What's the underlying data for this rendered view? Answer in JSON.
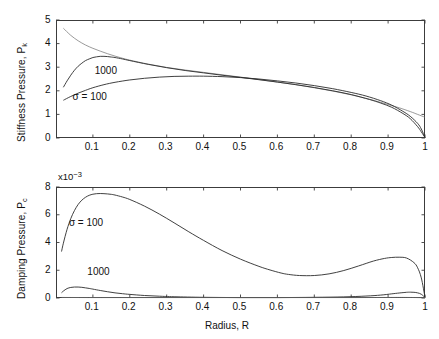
{
  "figure": {
    "background": "#ffffff",
    "axis_color": "#3c3c3c",
    "curve_color": "#2b2b2b",
    "curve_thin_color": "#6e6e6e"
  },
  "chart_data": [
    {
      "id": "stiffness",
      "type": "line",
      "title": "",
      "xlabel": "",
      "ylabel": "Stiffness Pressure, P",
      "ylabel_sub": "k",
      "xlim": [
        0,
        1
      ],
      "ylim": [
        0,
        5
      ],
      "xticks": [
        0.1,
        0.2,
        0.3,
        0.4,
        0.5,
        0.6,
        0.7,
        0.8,
        0.9,
        1
      ],
      "xticklabels": [
        "0.1",
        "0.2",
        "0.3",
        "0.4",
        "0.5",
        "0.6",
        "0.7",
        "0.8",
        "0.9",
        "1"
      ],
      "yticks": [
        0,
        1,
        2,
        3,
        4,
        5
      ],
      "yticklabels": [
        "0",
        "1",
        "2",
        "3",
        "4",
        "5"
      ],
      "grid": false,
      "legend_position": "inline-annotations",
      "annotations": [
        {
          "text": "1000",
          "x": 0.105,
          "y": 2.82
        },
        {
          "text": "σ = 100",
          "x": 0.045,
          "y": 1.72
        }
      ],
      "series": [
        {
          "name": "asymptotic",
          "style": "thin",
          "x": [
            0.02,
            0.04,
            0.06,
            0.08,
            0.1,
            0.12,
            0.14,
            0.16,
            0.18,
            0.2,
            0.25,
            0.3,
            0.35,
            0.4,
            0.45,
            0.5,
            0.55,
            0.6,
            0.65,
            0.7,
            0.75,
            0.8,
            0.85,
            0.9,
            0.93,
            0.96,
            0.98,
            1.0
          ],
          "y": [
            4.65,
            4.35,
            4.12,
            3.94,
            3.8,
            3.68,
            3.57,
            3.47,
            3.38,
            3.3,
            3.13,
            2.99,
            2.88,
            2.78,
            2.68,
            2.58,
            2.48,
            2.37,
            2.26,
            2.13,
            1.99,
            1.83,
            1.64,
            1.42,
            1.28,
            1.12,
            1.0,
            0.88
          ]
        },
        {
          "name": "1000",
          "style": "normal",
          "x": [
            0.02,
            0.03,
            0.04,
            0.05,
            0.06,
            0.07,
            0.08,
            0.09,
            0.1,
            0.11,
            0.12,
            0.13,
            0.14,
            0.15,
            0.16,
            0.18,
            0.2,
            0.25,
            0.3,
            0.35,
            0.4,
            0.45,
            0.5,
            0.55,
            0.6,
            0.65,
            0.7,
            0.75,
            0.8,
            0.85,
            0.88,
            0.91,
            0.94,
            0.96,
            0.98,
            0.99,
            1.0
          ],
          "y": [
            2.15,
            2.42,
            2.66,
            2.87,
            3.04,
            3.17,
            3.28,
            3.35,
            3.41,
            3.44,
            3.46,
            3.46,
            3.45,
            3.43,
            3.41,
            3.35,
            3.28,
            3.12,
            2.98,
            2.86,
            2.76,
            2.66,
            2.57,
            2.47,
            2.37,
            2.26,
            2.14,
            2.0,
            1.84,
            1.63,
            1.48,
            1.3,
            1.04,
            0.82,
            0.48,
            0.26,
            0.02
          ]
        },
        {
          "name": "100",
          "style": "normal",
          "x": [
            0.02,
            0.04,
            0.06,
            0.08,
            0.1,
            0.13,
            0.16,
            0.2,
            0.24,
            0.28,
            0.32,
            0.36,
            0.4,
            0.45,
            0.5,
            0.55,
            0.6,
            0.65,
            0.7,
            0.75,
            0.8,
            0.84,
            0.88,
            0.91,
            0.94,
            0.96,
            0.98,
            0.99,
            1.0
          ],
          "y": [
            1.6,
            1.76,
            1.9,
            2.02,
            2.13,
            2.26,
            2.36,
            2.46,
            2.53,
            2.58,
            2.61,
            2.62,
            2.62,
            2.6,
            2.56,
            2.5,
            2.42,
            2.33,
            2.22,
            2.09,
            1.93,
            1.78,
            1.58,
            1.39,
            1.13,
            0.92,
            0.62,
            0.38,
            0.02
          ]
        }
      ]
    },
    {
      "id": "damping",
      "type": "line",
      "title": "",
      "xlabel": "Radius, R",
      "ylabel": "Damping Pressure, P",
      "ylabel_sub": "c",
      "y_exponent": "x10",
      "y_exponent_power": "−3",
      "xlim": [
        0,
        1
      ],
      "ylim": [
        0,
        8
      ],
      "xticks": [
        0.1,
        0.2,
        0.3,
        0.4,
        0.5,
        0.6,
        0.7,
        0.8,
        0.9,
        1
      ],
      "xticklabels": [
        "0.1",
        "0.2",
        "0.3",
        "0.4",
        "0.5",
        "0.6",
        "0.7",
        "0.8",
        "0.9",
        "1"
      ],
      "yticks": [
        0,
        2,
        4,
        6,
        8
      ],
      "yticklabels": [
        "0",
        "2",
        "4",
        "6",
        "8"
      ],
      "grid": false,
      "legend_position": "inline-annotations",
      "annotations": [
        {
          "text": "σ = 100",
          "x": 0.035,
          "y": 5.35
        },
        {
          "text": "1000",
          "x": 0.085,
          "y": 1.85
        }
      ],
      "series": [
        {
          "name": "100",
          "style": "normal",
          "x": [
            0.015,
            0.02,
            0.03,
            0.04,
            0.05,
            0.06,
            0.07,
            0.08,
            0.09,
            0.1,
            0.11,
            0.12,
            0.13,
            0.14,
            0.15,
            0.16,
            0.18,
            0.2,
            0.24,
            0.28,
            0.32,
            0.36,
            0.4,
            0.45,
            0.5,
            0.55,
            0.58,
            0.61,
            0.63,
            0.66,
            0.7,
            0.74,
            0.78,
            0.82,
            0.86,
            0.89,
            0.91,
            0.93,
            0.95,
            0.97,
            0.98,
            0.99,
            1.0
          ],
          "y": [
            3.35,
            3.95,
            4.95,
            5.72,
            6.3,
            6.74,
            7.05,
            7.26,
            7.4,
            7.48,
            7.52,
            7.53,
            7.52,
            7.5,
            7.47,
            7.42,
            7.28,
            7.1,
            6.62,
            6.05,
            5.42,
            4.77,
            4.15,
            3.42,
            2.8,
            2.28,
            2.02,
            1.8,
            1.7,
            1.62,
            1.62,
            1.74,
            1.98,
            2.31,
            2.66,
            2.85,
            2.92,
            2.94,
            2.88,
            2.55,
            2.18,
            1.45,
            0.05
          ]
        },
        {
          "name": "1000",
          "style": "normal",
          "x": [
            0.015,
            0.02,
            0.03,
            0.04,
            0.05,
            0.06,
            0.07,
            0.08,
            0.09,
            0.1,
            0.12,
            0.14,
            0.16,
            0.18,
            0.2,
            0.24,
            0.28,
            0.32,
            0.4,
            0.5,
            0.6,
            0.7,
            0.78,
            0.84,
            0.88,
            0.91,
            0.93,
            0.95,
            0.96,
            0.97,
            0.98,
            0.99,
            1.0
          ],
          "y": [
            0.38,
            0.5,
            0.68,
            0.76,
            0.79,
            0.79,
            0.77,
            0.73,
            0.69,
            0.64,
            0.54,
            0.45,
            0.37,
            0.31,
            0.26,
            0.18,
            0.13,
            0.09,
            0.05,
            0.03,
            0.03,
            0.05,
            0.08,
            0.14,
            0.21,
            0.3,
            0.36,
            0.41,
            0.42,
            0.41,
            0.37,
            0.27,
            0.03
          ]
        },
        {
          "name": "baseline",
          "style": "thin",
          "x": [
            0.015,
            0.1,
            0.2,
            0.3,
            0.4,
            0.5,
            0.6,
            0.7,
            0.8,
            0.9,
            0.95,
            1.0
          ],
          "y": [
            0.04,
            0.03,
            0.03,
            0.03,
            0.03,
            0.03,
            0.03,
            0.03,
            0.03,
            0.04,
            0.04,
            0.02
          ]
        }
      ]
    }
  ]
}
